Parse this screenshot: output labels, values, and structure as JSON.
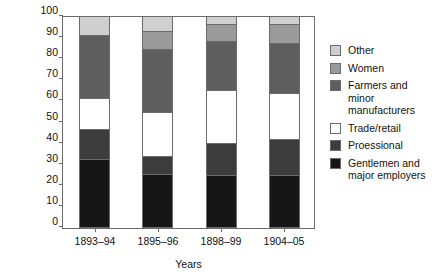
{
  "chart_data": {
    "type": "bar",
    "subtype": "stacked-bar-100-percent",
    "title": "",
    "xlabel": "Years",
    "ylabel": "Occupational distribution (%)",
    "categories": [
      "1893–94",
      "1895–96",
      "1898–99",
      "1904–05"
    ],
    "ylim": [
      0,
      100
    ],
    "yticks": [
      0,
      10,
      20,
      30,
      40,
      50,
      60,
      70,
      80,
      90,
      100
    ],
    "ytick_labels": [
      "0",
      "10",
      "20",
      "30",
      "40",
      "50",
      "60",
      "70",
      "80",
      "90",
      "100"
    ],
    "grid": false,
    "legend_position": "right",
    "stack_order_bottom_to_top": [
      "Gentlemen and major employers",
      "Proessional",
      "Trade/retail",
      "Farmers and minor manufacturers",
      "Women",
      "Other"
    ],
    "series": [
      {
        "name": "Gentlemen and major employers",
        "color": "#161616",
        "values": [
          32.0,
          25.0,
          24.5,
          24.5
        ]
      },
      {
        "name": "Proessional",
        "color": "#3c3c3c",
        "values": [
          14.5,
          8.5,
          15.5,
          17.0
        ]
      },
      {
        "name": "Trade/retail",
        "color": "#ffffff",
        "values": [
          14.5,
          21.0,
          25.0,
          22.0
        ]
      },
      {
        "name": "Farmers and minor manufacturers",
        "color": "#5e5e5e",
        "values": [
          30.0,
          30.0,
          23.0,
          23.5
        ]
      },
      {
        "name": "Women",
        "color": "#9b9b9b",
        "values": [
          0.0,
          8.5,
          8.0,
          9.0
        ]
      },
      {
        "name": "Other",
        "color": "#cfcfcf",
        "values": [
          9.0,
          7.0,
          4.0,
          4.0
        ]
      }
    ],
    "cumulative_tops_bottom_to_top": [
      [
        32.0,
        46.5,
        61.0,
        91.0,
        91.0,
        100.0
      ],
      [
        25.0,
        33.5,
        54.5,
        84.5,
        93.0,
        100.0
      ],
      [
        24.5,
        40.0,
        65.0,
        88.0,
        96.0,
        100.0
      ],
      [
        24.5,
        41.5,
        63.5,
        87.0,
        96.0,
        100.0
      ]
    ]
  },
  "legend": {
    "items": [
      {
        "label": "Other",
        "color": "#cfcfcf"
      },
      {
        "label": "Women",
        "color": "#9b9b9b"
      },
      {
        "label": "Farmers and minor",
        "label2": "manufacturers",
        "color": "#5e5e5e"
      },
      {
        "label": "Trade/retail",
        "color": "#ffffff"
      },
      {
        "label": "Proessional",
        "color": "#3c3c3c"
      },
      {
        "label": "Gentlemen and",
        "label2": "major employers",
        "color": "#161616"
      }
    ]
  },
  "colors": {
    "other": "#cfcfcf",
    "women": "#9b9b9b",
    "farmers": "#5e5e5e",
    "trade": "#ffffff",
    "professional": "#3c3c3c",
    "gentlemen": "#161616",
    "axis": "#6b6b6b",
    "text": "#111111"
  }
}
